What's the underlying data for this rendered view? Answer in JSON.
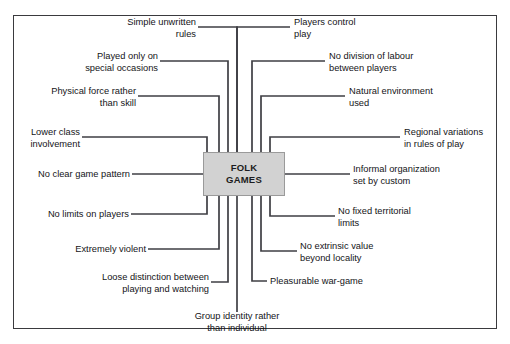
{
  "diagram": {
    "type": "spider-map",
    "center": {
      "line1": "FOLK",
      "line2": "GAMES",
      "fill_color": "#d2d2d2",
      "border_color": "#9a9a9a"
    },
    "frame": {
      "border_color": "#3a3a3e"
    },
    "line_color": "#3f3f44",
    "nodes": [
      {
        "id": "simple-unwritten-rules",
        "text": "Simple unwritten\nrules",
        "side": "top",
        "align": "right"
      },
      {
        "id": "played-only-special-occasions",
        "text": "Played only on\nspecial occasions",
        "side": "top",
        "align": "right"
      },
      {
        "id": "physical-force-rather",
        "text": "Physical force rather\nthan skill",
        "side": "top",
        "align": "right"
      },
      {
        "id": "lower-class-involvement",
        "text": "Lower class\ninvolvement",
        "side": "left",
        "align": "right"
      },
      {
        "id": "no-clear-game-pattern",
        "text": "No clear game pattern",
        "side": "left",
        "align": "right"
      },
      {
        "id": "no-limits-on-players",
        "text": "No limits on players",
        "side": "left",
        "align": "right"
      },
      {
        "id": "extremely-violent",
        "text": "Extremely violent",
        "side": "bottom",
        "align": "right"
      },
      {
        "id": "loose-distinction",
        "text": "Loose distinction between\nplaying and watching",
        "side": "bottom",
        "align": "right"
      },
      {
        "id": "group-identity-rather",
        "text": "Group identity rather\nthan individual",
        "side": "bottom",
        "align": "center"
      },
      {
        "id": "pleasurable-war-game",
        "text": "Pleasurable war-game",
        "side": "bottom",
        "align": "left"
      },
      {
        "id": "no-extrinsic-value",
        "text": "No extrinsic value\nbeyond locality",
        "side": "bottom",
        "align": "left"
      },
      {
        "id": "no-fixed-territorial-limits",
        "text": "No fixed territorial\nlimits",
        "side": "right",
        "align": "left"
      },
      {
        "id": "informal-organization",
        "text": "Informal organization\nset by custom",
        "side": "right",
        "align": "left"
      },
      {
        "id": "regional-variations",
        "text": "Regional variations\nin rules of play",
        "side": "right",
        "align": "left"
      },
      {
        "id": "natural-environment-used",
        "text": "Natural environment\nused",
        "side": "top",
        "align": "left"
      },
      {
        "id": "no-division-of-labour",
        "text": "No division of labour\nbetween players",
        "side": "top",
        "align": "left"
      },
      {
        "id": "players-control-play",
        "text": "Players control\nplay",
        "side": "top",
        "align": "left"
      }
    ]
  }
}
